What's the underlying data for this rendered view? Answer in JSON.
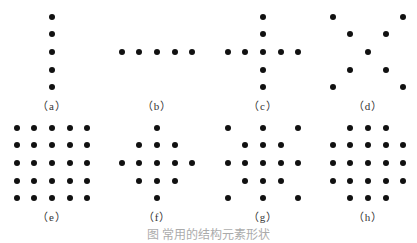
{
  "figure": {
    "caption": "图 常用的结构元素形状",
    "panels": [
      {
        "id": "a",
        "label": "（a）",
        "cx": 52,
        "cy": 52,
        "dots": [
          [
            0,
            -2
          ],
          [
            0,
            -1
          ],
          [
            0,
            0
          ],
          [
            0,
            1
          ],
          [
            0,
            2
          ]
        ]
      },
      {
        "id": "b",
        "label": "（b）",
        "cx": 157,
        "cy": 52,
        "dots": [
          [
            -2,
            0
          ],
          [
            -1,
            0
          ],
          [
            0,
            0
          ],
          [
            1,
            0
          ],
          [
            2,
            0
          ]
        ]
      },
      {
        "id": "c",
        "label": "（c）",
        "cx": 263,
        "cy": 52,
        "dots": [
          [
            0,
            -2
          ],
          [
            0,
            -1
          ],
          [
            -2,
            0
          ],
          [
            -1,
            0
          ],
          [
            0,
            0
          ],
          [
            1,
            0
          ],
          [
            2,
            0
          ],
          [
            0,
            1
          ],
          [
            0,
            2
          ]
        ]
      },
      {
        "id": "d",
        "label": "（d）",
        "cx": 368,
        "cy": 52,
        "dots": [
          [
            -2,
            -2
          ],
          [
            2,
            -2
          ],
          [
            -1,
            -1
          ],
          [
            1,
            -1
          ],
          [
            0,
            0
          ],
          [
            -1,
            1
          ],
          [
            1,
            1
          ],
          [
            -2,
            2
          ],
          [
            2,
            2
          ]
        ]
      },
      {
        "id": "e",
        "label": "（e）",
        "cx": 52,
        "cy": 163,
        "dots": [
          [
            -2,
            -2
          ],
          [
            -1,
            -2
          ],
          [
            0,
            -2
          ],
          [
            1,
            -2
          ],
          [
            2,
            -2
          ],
          [
            -2,
            -1
          ],
          [
            -1,
            -1
          ],
          [
            0,
            -1
          ],
          [
            1,
            -1
          ],
          [
            2,
            -1
          ],
          [
            -2,
            0
          ],
          [
            -1,
            0
          ],
          [
            0,
            0
          ],
          [
            1,
            0
          ],
          [
            2,
            0
          ],
          [
            -2,
            1
          ],
          [
            -1,
            1
          ],
          [
            0,
            1
          ],
          [
            1,
            1
          ],
          [
            2,
            1
          ],
          [
            -2,
            2
          ],
          [
            -1,
            2
          ],
          [
            0,
            2
          ],
          [
            1,
            2
          ],
          [
            2,
            2
          ]
        ]
      },
      {
        "id": "f",
        "label": "（f）",
        "cx": 157,
        "cy": 163,
        "dots": [
          [
            0,
            -2
          ],
          [
            -1,
            -1
          ],
          [
            0,
            -1
          ],
          [
            1,
            -1
          ],
          [
            -2,
            0
          ],
          [
            -1,
            0
          ],
          [
            0,
            0
          ],
          [
            1,
            0
          ],
          [
            2,
            0
          ],
          [
            -1,
            1
          ],
          [
            0,
            1
          ],
          [
            1,
            1
          ],
          [
            0,
            2
          ]
        ]
      },
      {
        "id": "g",
        "label": "（g）",
        "cx": 263,
        "cy": 163,
        "dots": [
          [
            -2,
            -2
          ],
          [
            0,
            -2
          ],
          [
            2,
            -2
          ],
          [
            -1,
            -1
          ],
          [
            0,
            -1
          ],
          [
            1,
            -1
          ],
          [
            -2,
            0
          ],
          [
            -1,
            0
          ],
          [
            0,
            0
          ],
          [
            1,
            0
          ],
          [
            2,
            0
          ],
          [
            -1,
            1
          ],
          [
            0,
            1
          ],
          [
            1,
            1
          ],
          [
            -2,
            2
          ],
          [
            0,
            2
          ],
          [
            2,
            2
          ]
        ]
      },
      {
        "id": "h",
        "label": "（h）",
        "cx": 368,
        "cy": 163,
        "dots": [
          [
            -1,
            -2
          ],
          [
            0,
            -2
          ],
          [
            1,
            -2
          ],
          [
            -2,
            -1
          ],
          [
            -1,
            -1
          ],
          [
            0,
            -1
          ],
          [
            1,
            -1
          ],
          [
            2,
            -1
          ],
          [
            -2,
            0
          ],
          [
            -1,
            0
          ],
          [
            0,
            0
          ],
          [
            1,
            0
          ],
          [
            2,
            0
          ],
          [
            -2,
            1
          ],
          [
            -1,
            1
          ],
          [
            0,
            1
          ],
          [
            1,
            1
          ],
          [
            2,
            1
          ],
          [
            -1,
            2
          ],
          [
            0,
            2
          ],
          [
            1,
            2
          ]
        ]
      }
    ],
    "spacing": 17.6,
    "dot_color": "#111111"
  }
}
